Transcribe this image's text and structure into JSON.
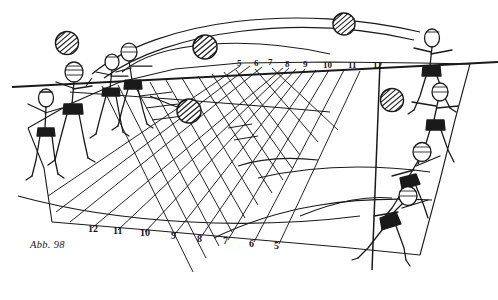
{
  "figure": {
    "caption": "Abb. 98",
    "background_color": "#ffffff",
    "ink_color": "#1a1a1a"
  },
  "net": {
    "label": "net-line",
    "color": "#1a1a1a"
  },
  "zone_numbers_far": {
    "label": "far-side-zone-numbers",
    "values": [
      "5",
      "6",
      "7",
      "8",
      "9",
      "10",
      "11",
      "12"
    ],
    "x": [
      237,
      254,
      268,
      285,
      303,
      325,
      350,
      375
    ],
    "y": [
      64,
      64,
      63,
      65,
      65,
      66,
      66,
      66
    ]
  },
  "zone_numbers_near": {
    "label": "near-side-zone-numbers",
    "values": [
      "12",
      "11",
      "10",
      "9",
      "8",
      "7",
      "6",
      "5"
    ],
    "x": [
      88,
      113,
      140,
      170,
      196,
      222,
      248,
      272
    ],
    "y": [
      228,
      230,
      232,
      234,
      237,
      239,
      241,
      243
    ]
  },
  "balls": {
    "label": "volleyballs",
    "count": 5,
    "positions": [
      {
        "cx": 205,
        "cy": 47,
        "r": 13
      },
      {
        "cx": 344,
        "cy": 24,
        "r": 11
      },
      {
        "cx": 189,
        "cy": 111,
        "r": 13
      },
      {
        "cx": 67,
        "cy": 43,
        "r": 12
      },
      {
        "cx": 392,
        "cy": 100,
        "r": 12
      }
    ]
  },
  "players_left": {
    "label": "receiving-team-players",
    "count": 4
  },
  "players_right": {
    "label": "attacking-team-players",
    "count": 4
  },
  "trajectories": {
    "label": "ball-flight-paths",
    "arc_count": 6,
    "ray_count": 16
  }
}
